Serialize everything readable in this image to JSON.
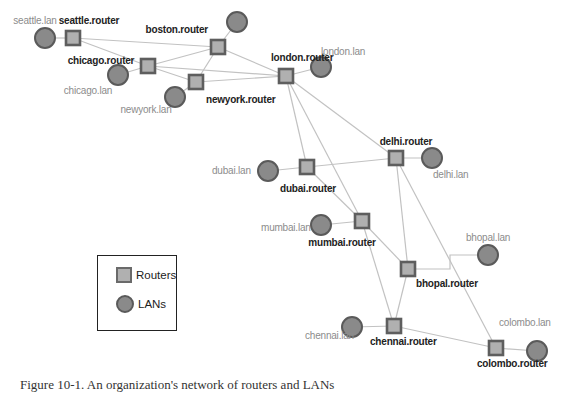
{
  "diagram": {
    "routers": [
      {
        "id": "seattle",
        "label": "seattle.router",
        "x": 73,
        "y": 38,
        "lx": 89,
        "ly": 24,
        "anchor": "middle"
      },
      {
        "id": "chicago",
        "label": "chicago.router",
        "x": 148,
        "y": 66,
        "lx": 101,
        "ly": 64,
        "anchor": "middle"
      },
      {
        "id": "boston",
        "label": "boston.router",
        "x": 218,
        "y": 47,
        "lx": 208,
        "ly": 33,
        "anchor": "end"
      },
      {
        "id": "newyork",
        "label": "newyork.router",
        "x": 196,
        "y": 82,
        "lx": 206,
        "ly": 103,
        "anchor": "start"
      },
      {
        "id": "london",
        "label": "london.router",
        "x": 286,
        "y": 76,
        "lx": 271,
        "ly": 61,
        "anchor": "start"
      },
      {
        "id": "dubai",
        "label": "dubai.router",
        "x": 307,
        "y": 167,
        "lx": 308,
        "ly": 192,
        "anchor": "middle"
      },
      {
        "id": "delhi",
        "label": "delhi.router",
        "x": 396,
        "y": 158,
        "lx": 406,
        "ly": 145,
        "anchor": "middle"
      },
      {
        "id": "mumbai",
        "label": "mumbai.router",
        "x": 362,
        "y": 221,
        "lx": 342,
        "ly": 246,
        "anchor": "middle"
      },
      {
        "id": "bhopal",
        "label": "bhopal.router",
        "x": 408,
        "y": 269,
        "lx": 416,
        "ly": 287,
        "anchor": "start"
      },
      {
        "id": "chennai",
        "label": "chennai.router",
        "x": 394,
        "y": 326,
        "lx": 370,
        "ly": 345,
        "anchor": "start"
      },
      {
        "id": "colombo",
        "label": "colombo.router",
        "x": 496,
        "y": 348,
        "lx": 477,
        "ly": 367,
        "anchor": "start"
      }
    ],
    "lans": [
      {
        "id": "seattle-lan",
        "label": "seattle.lan",
        "x": 45,
        "y": 38,
        "lx": 35,
        "ly": 24,
        "anchor": "middle"
      },
      {
        "id": "chicago-lan",
        "label": "chicago.lan",
        "x": 118,
        "y": 75,
        "lx": 88,
        "ly": 94,
        "anchor": "middle"
      },
      {
        "id": "boston-lan",
        "label": "boston.lan",
        "x": 237,
        "y": 22,
        "lx": 0,
        "ly": 0,
        "anchor": "middle",
        "hide_label": true
      },
      {
        "id": "newyork-lan",
        "label": "newyork.lan",
        "x": 175,
        "y": 97,
        "lx": 146,
        "ly": 113,
        "anchor": "middle"
      },
      {
        "id": "london-lan",
        "label": "london.lan",
        "x": 321,
        "y": 67,
        "lx": 321,
        "ly": 55,
        "anchor": "start"
      },
      {
        "id": "dubai-lan",
        "label": "dubai.lan",
        "x": 268,
        "y": 171,
        "lx": 212,
        "ly": 174,
        "anchor": "start"
      },
      {
        "id": "delhi-lan",
        "label": "delhi.lan",
        "x": 432,
        "y": 158,
        "lx": 433,
        "ly": 178,
        "anchor": "start"
      },
      {
        "id": "mumbai-lan",
        "label": "mumbai.lan",
        "x": 321,
        "y": 225,
        "lx": 261,
        "ly": 231,
        "anchor": "start"
      },
      {
        "id": "bhopal-lan",
        "label": "bhopal.lan",
        "x": 488,
        "y": 255,
        "lx": 466,
        "ly": 241,
        "anchor": "start"
      },
      {
        "id": "chennai-lan",
        "label": "chennai.lan",
        "x": 352,
        "y": 327,
        "lx": 305,
        "ly": 339,
        "anchor": "start"
      },
      {
        "id": "colombo-lan",
        "label": "colombo.lan",
        "x": 537,
        "y": 351,
        "lx": 499,
        "ly": 326,
        "anchor": "start"
      }
    ],
    "edges": [
      [
        "seattle",
        "seattle-lan"
      ],
      [
        "seattle",
        "chicago"
      ],
      [
        "seattle",
        "boston"
      ],
      [
        "chicago",
        "chicago-lan"
      ],
      [
        "chicago",
        "boston"
      ],
      [
        "chicago",
        "newyork"
      ],
      [
        "chicago",
        "london"
      ],
      [
        "boston",
        "boston-lan"
      ],
      [
        "boston",
        "newyork"
      ],
      [
        "boston",
        "london"
      ],
      [
        "newyork",
        "newyork-lan"
      ],
      [
        "newyork",
        "london"
      ],
      [
        "london",
        "london-lan"
      ],
      [
        "london",
        "dubai"
      ],
      [
        "london",
        "mumbai"
      ],
      [
        "london",
        "delhi"
      ],
      [
        "dubai",
        "dubai-lan"
      ],
      [
        "dubai",
        "delhi"
      ],
      [
        "dubai",
        "mumbai"
      ],
      [
        "delhi",
        "delhi-lan"
      ],
      [
        "delhi",
        "bhopal"
      ],
      [
        "delhi",
        "colombo"
      ],
      [
        "mumbai",
        "mumbai-lan"
      ],
      [
        "mumbai",
        "bhopal"
      ],
      [
        "mumbai",
        "chennai"
      ],
      [
        "bhopal",
        "chennai"
      ],
      [
        "chennai",
        "chennai-lan"
      ],
      [
        "chennai",
        "colombo"
      ],
      [
        "colombo",
        "colombo-lan"
      ]
    ],
    "elbow_edges": [
      {
        "from": "bhopal",
        "to": "bhopal-lan",
        "points": [
          [
            408,
            269
          ],
          [
            450,
            269
          ],
          [
            450,
            255
          ],
          [
            488,
            255
          ]
        ]
      }
    ]
  },
  "legend": {
    "routers_label": "Routers",
    "lans_label": "LANs"
  },
  "caption": "Figure 10-1. An organization's network of routers and LANs"
}
